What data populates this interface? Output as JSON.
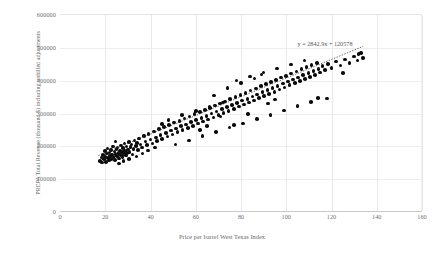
{
  "chart_data": {
    "type": "scatter",
    "title": "",
    "xlabel": "Price per barrel West Texas Index",
    "ylabel": "PREPA Total Revenue (thousand $) including unbilled adjustments",
    "xlim": [
      0,
      160
    ],
    "ylim": [
      0,
      600000
    ],
    "xticks": [
      0,
      20,
      40,
      60,
      80,
      100,
      120,
      140,
      160
    ],
    "yticks": [
      0,
      100000,
      200000,
      300000,
      400000,
      500000,
      600000
    ],
    "xtick_labels": [
      "0",
      "20",
      "40",
      "60",
      "80",
      "100",
      "120",
      "140",
      "160"
    ],
    "ytick_labels": [
      "0",
      "100000",
      "200000",
      "300000",
      "400000",
      "500000",
      "600000"
    ],
    "grid": true,
    "legend": false,
    "marker_color": "#0b0b0b",
    "gridline_color": "#e8e8e8",
    "trendline": {
      "type": "linear",
      "slope": 2842.9,
      "intercept": 120578,
      "equation": "y = 2842.9x + 120578",
      "style": "dotted",
      "color": "#3f3f3f",
      "x_start": 17,
      "x_end": 134
    },
    "points": [
      [
        17.8,
        152000
      ],
      [
        18.3,
        163000
      ],
      [
        18.6,
        148000
      ],
      [
        19.1,
        171000
      ],
      [
        19.4,
        158000
      ],
      [
        19.8,
        182000
      ],
      [
        20.1,
        166000
      ],
      [
        20.4,
        149000
      ],
      [
        20.8,
        175000
      ],
      [
        21.0,
        190000
      ],
      [
        21.3,
        161000
      ],
      [
        21.6,
        154000
      ],
      [
        21.9,
        178000
      ],
      [
        22.2,
        168000
      ],
      [
        22.5,
        186000
      ],
      [
        22.8,
        159000
      ],
      [
        23.1,
        172000
      ],
      [
        23.4,
        196000
      ],
      [
        23.7,
        164000
      ],
      [
        24.0,
        181000
      ],
      [
        24.3,
        155000
      ],
      [
        24.6,
        174000
      ],
      [
        24.9,
        188000
      ],
      [
        25.2,
        167000
      ],
      [
        25.5,
        193000
      ],
      [
        25.8,
        177000
      ],
      [
        26.1,
        160000
      ],
      [
        26.4,
        184000
      ],
      [
        26.7,
        170000
      ],
      [
        27.0,
        199000
      ],
      [
        27.3,
        179000
      ],
      [
        27.6,
        165000
      ],
      [
        27.9,
        191000
      ],
      [
        28.2,
        173000
      ],
      [
        28.5,
        205000
      ],
      [
        28.8,
        183000
      ],
      [
        29.1,
        169000
      ],
      [
        29.4,
        197000
      ],
      [
        29.7,
        176000
      ],
      [
        30.0,
        187000
      ],
      [
        30.4,
        210000
      ],
      [
        30.8,
        180000
      ],
      [
        31.2,
        195000
      ],
      [
        31.6,
        202000
      ],
      [
        32.0,
        172000
      ],
      [
        32.5,
        189000
      ],
      [
        33.0,
        215000
      ],
      [
        33.5,
        198000
      ],
      [
        34.0,
        207000
      ],
      [
        34.5,
        185000
      ],
      [
        35.0,
        221000
      ],
      [
        35.5,
        203000
      ],
      [
        36.2,
        194000
      ],
      [
        37.0,
        228000
      ],
      [
        37.8,
        212000
      ],
      [
        38.5,
        201000
      ],
      [
        39.2,
        235000
      ],
      [
        40.0,
        218000
      ],
      [
        40.8,
        206000
      ],
      [
        41.5,
        242000
      ],
      [
        42.3,
        224000
      ],
      [
        43.0,
        213000
      ],
      [
        43.8,
        249000
      ],
      [
        44.5,
        231000
      ],
      [
        45.2,
        220000
      ],
      [
        46.0,
        256000
      ],
      [
        46.8,
        238000
      ],
      [
        47.5,
        227000
      ],
      [
        48.2,
        262000
      ],
      [
        49.0,
        245000
      ],
      [
        49.8,
        233000
      ],
      [
        50.5,
        269000
      ],
      [
        51.2,
        251000
      ],
      [
        52.0,
        240000
      ],
      [
        52.8,
        275000
      ],
      [
        53.5,
        258000
      ],
      [
        54.2,
        246000
      ],
      [
        55.0,
        282000
      ],
      [
        55.8,
        264000
      ],
      [
        56.5,
        253000
      ],
      [
        57.2,
        288000
      ],
      [
        58.0,
        271000
      ],
      [
        58.8,
        259000
      ],
      [
        59.5,
        295000
      ],
      [
        60.2,
        277000
      ],
      [
        61.0,
        266000
      ],
      [
        61.8,
        301000
      ],
      [
        62.5,
        284000
      ],
      [
        63.2,
        272000
      ],
      [
        64.0,
        308000
      ],
      [
        64.8,
        290000
      ],
      [
        65.5,
        279000
      ],
      [
        66.2,
        314000
      ],
      [
        67.0,
        297000
      ],
      [
        67.8,
        285000
      ],
      [
        68.5,
        321000
      ],
      [
        69.2,
        303000
      ],
      [
        70.0,
        292000
      ],
      [
        70.8,
        327000
      ],
      [
        71.5,
        310000
      ],
      [
        72.2,
        298000
      ],
      [
        73.0,
        334000
      ],
      [
        73.8,
        316000
      ],
      [
        74.5,
        305000
      ],
      [
        75.2,
        341000
      ],
      [
        76.0,
        323000
      ],
      [
        76.8,
        311000
      ],
      [
        77.5,
        347000
      ],
      [
        78.2,
        329000
      ],
      [
        79.0,
        318000
      ],
      [
        79.8,
        354000
      ],
      [
        80.5,
        336000
      ],
      [
        81.2,
        324000
      ],
      [
        82.0,
        360000
      ],
      [
        82.8,
        342000
      ],
      [
        83.5,
        331000
      ],
      [
        84.2,
        367000
      ],
      [
        85.0,
        349000
      ],
      [
        85.8,
        337000
      ],
      [
        86.5,
        373000
      ],
      [
        87.2,
        355000
      ],
      [
        88.0,
        344000
      ],
      [
        88.8,
        380000
      ],
      [
        89.5,
        362000
      ],
      [
        90.2,
        350000
      ],
      [
        91.0,
        386000
      ],
      [
        91.8,
        368000
      ],
      [
        92.5,
        357000
      ],
      [
        93.2,
        393000
      ],
      [
        94.0,
        375000
      ],
      [
        94.8,
        363000
      ],
      [
        95.5,
        399000
      ],
      [
        96.2,
        381000
      ],
      [
        97.0,
        370000
      ],
      [
        97.8,
        406000
      ],
      [
        98.5,
        388000
      ],
      [
        99.2,
        376000
      ],
      [
        100.0,
        412000
      ],
      [
        100.8,
        394000
      ],
      [
        101.5,
        383000
      ],
      [
        102.2,
        419000
      ],
      [
        103.0,
        401000
      ],
      [
        103.8,
        389000
      ],
      [
        104.5,
        425000
      ],
      [
        105.2,
        407000
      ],
      [
        106.0,
        396000
      ],
      [
        106.8,
        432000
      ],
      [
        107.5,
        414000
      ],
      [
        108.2,
        402000
      ],
      [
        109.0,
        438000
      ],
      [
        109.8,
        420000
      ],
      [
        110.5,
        409000
      ],
      [
        111.2,
        445000
      ],
      [
        112.0,
        427000
      ],
      [
        112.8,
        415000
      ],
      [
        113.5,
        451000
      ],
      [
        114.2,
        433000
      ],
      [
        115.0,
        422000
      ],
      [
        116.0,
        441000
      ],
      [
        117.0,
        429000
      ],
      [
        118.5,
        448000
      ],
      [
        120.0,
        436000
      ],
      [
        122.0,
        455000
      ],
      [
        124.0,
        443000
      ],
      [
        126.0,
        462000
      ],
      [
        128.0,
        450000
      ],
      [
        130.0,
        470000
      ],
      [
        131.5,
        458000
      ],
      [
        133.0,
        482000
      ],
      [
        134.0,
        466000
      ],
      [
        24.5,
        212000
      ],
      [
        26.0,
        145000
      ],
      [
        28.0,
        152000
      ],
      [
        30.5,
        158000
      ],
      [
        33.8,
        166000
      ],
      [
        36.5,
        175000
      ],
      [
        39.0,
        184000
      ],
      [
        42.0,
        193000
      ],
      [
        45.0,
        265000
      ],
      [
        48.0,
        278000
      ],
      [
        51.0,
        202000
      ],
      [
        54.0,
        292000
      ],
      [
        57.0,
        215000
      ],
      [
        60.0,
        305000
      ],
      [
        63.0,
        228000
      ],
      [
        66.0,
        318000
      ],
      [
        69.0,
        241000
      ],
      [
        72.0,
        331000
      ],
      [
        75.0,
        254000
      ],
      [
        78.0,
        398000
      ],
      [
        81.0,
        267000
      ],
      [
        84.0,
        410000
      ],
      [
        87.0,
        280000
      ],
      [
        90.0,
        422000
      ],
      [
        93.0,
        293000
      ],
      [
        96.0,
        434000
      ],
      [
        99.0,
        306000
      ],
      [
        102.0,
        446000
      ],
      [
        105.0,
        319000
      ],
      [
        108.0,
        458000
      ],
      [
        111.0,
        332000
      ],
      [
        114.0,
        345000
      ],
      [
        86.0,
        404000
      ],
      [
        89.0,
        416000
      ],
      [
        92.0,
        327000
      ],
      [
        95.0,
        339000
      ],
      [
        71.0,
        288000
      ],
      [
        74.0,
        375000
      ],
      [
        77.0,
        262000
      ],
      [
        80.0,
        389000
      ],
      [
        62.0,
        246000
      ],
      [
        65.0,
        259000
      ],
      [
        68.0,
        352000
      ],
      [
        83.0,
        296000
      ],
      [
        118.0,
        343000
      ],
      [
        125.0,
        421000
      ],
      [
        132.0,
        478000
      ]
    ]
  }
}
